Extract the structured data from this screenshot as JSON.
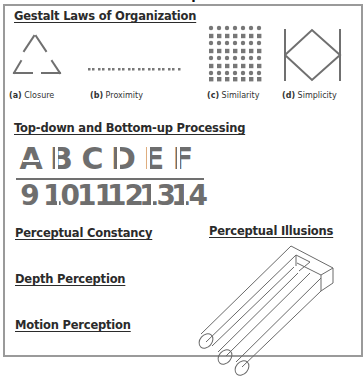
{
  "top_cut_text": "Perception",
  "gestalt": {
    "title": "Gestalt Laws of Organization",
    "items": [
      {
        "label_letter": "(a)",
        "label_text": " Closure",
        "icon": "closure-triangle-icon"
      },
      {
        "label_letter": "(b)",
        "label_text": " Proximity",
        "icon": "proximity-dots-icon"
      },
      {
        "label_letter": "(c)",
        "label_text": " Similarity",
        "icon": "similarity-grid-icon"
      },
      {
        "label_letter": "(d)",
        "label_text": " Simplicity",
        "icon": "simplicity-shape-icon"
      }
    ]
  },
  "processing": {
    "title": "Top-down and Bottom-up Processing",
    "letters": [
      "A",
      "B",
      "C",
      "D",
      "E",
      "F"
    ],
    "numbers": [
      "9",
      "10",
      "11",
      "12",
      "13",
      "14"
    ]
  },
  "sections": {
    "constancy": "Perceptual Constancy",
    "depth": "Depth Perception",
    "motion": "Motion Perception",
    "illusions": "Perceptual Illusions"
  },
  "colors": {
    "figure_gray": "#6e6e6e",
    "frame_border": "#9a9a9a",
    "heading_text": "#2b2b2b"
  }
}
